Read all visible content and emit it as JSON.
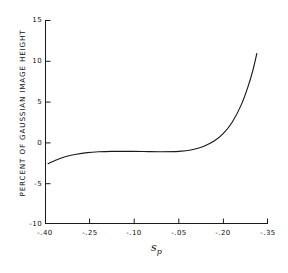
{
  "chart_data": {
    "type": "line",
    "title": "",
    "xlabel": "s_p",
    "xlabel_symbol": "s",
    "xlabel_subscript": "p",
    "ylabel": "PERCENT OF GAUSSIAN IMAGE HEIGHT",
    "xtick_labels": [
      "-.40",
      "-.25",
      "-.10",
      "-.05",
      "-.20",
      "-.35"
    ],
    "ytick_labels": [
      "15",
      "10",
      "5",
      "0",
      "-5",
      "-10"
    ],
    "ylim": [
      -10,
      15
    ],
    "xlim": [
      0,
      5
    ],
    "grid": false,
    "legend": null,
    "series": [
      {
        "name": "percent of gaussian image height",
        "comment": "x given as tick-index position (0=-.40 .. 5=-.35); y in percent",
        "x": [
          0.07,
          0.25,
          0.45,
          0.7,
          0.95,
          1.2,
          1.5,
          1.85,
          2.2,
          2.6,
          3.0,
          3.3,
          3.55,
          3.8,
          4.0,
          4.2,
          4.4,
          4.55,
          4.65,
          4.75
        ],
        "y": [
          -2.6,
          -2.15,
          -1.75,
          -1.45,
          -1.25,
          -1.15,
          -1.1,
          -1.1,
          -1.12,
          -1.15,
          -1.1,
          -0.9,
          -0.5,
          0.2,
          1.1,
          2.5,
          4.6,
          6.8,
          8.6,
          10.9
        ]
      }
    ]
  },
  "caption": {
    "partial_text": ""
  },
  "style": {
    "line_color": "#1a1a1a",
    "axis_color": "#1a1a1a",
    "background": "#ffffff"
  }
}
